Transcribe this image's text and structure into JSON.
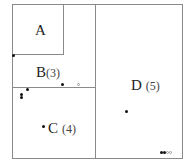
{
  "diagram": {
    "regions": [
      {
        "id": "A",
        "label": "A",
        "count": ""
      },
      {
        "id": "B",
        "label": "B",
        "count": "(3)"
      },
      {
        "id": "C",
        "label": "C",
        "count": "(4)"
      },
      {
        "id": "D",
        "label": "D",
        "count": "(5)"
      }
    ],
    "colors": {
      "border": "#8a8a8a",
      "point": "#111111",
      "hollow_point": "#999999"
    }
  }
}
